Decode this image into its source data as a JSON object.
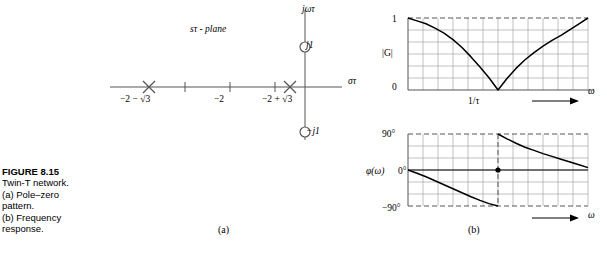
{
  "caption": {
    "figure_number": "FIGURE 8.15",
    "lines": [
      "Twin-T network.",
      "(a) Pole–zero",
      "pattern.",
      "(b) Frequency",
      "response."
    ]
  },
  "subfigure_labels": {
    "a": "(a)",
    "b": "(b)"
  },
  "colors": {
    "curve": "#000000",
    "axis": "#555555",
    "grid": "#999999",
    "dashed": "#555555",
    "marker": "#555555",
    "text": "#000000"
  },
  "pole_zero_plot": {
    "plane_label": "sτ - plane",
    "real_axis_label": "στ",
    "imag_axis_label": "jωτ",
    "tick_labels": [
      "−2 − √3",
      "−2",
      "−2 + √3"
    ],
    "zero_labels": [
      "j1",
      "−j1"
    ],
    "poles": [
      {
        "label": "−2 − √3",
        "real": -3.732,
        "imag": 0,
        "marker": "cross"
      },
      {
        "label": "−2 + √3",
        "real": -0.268,
        "imag": 0,
        "marker": "cross"
      }
    ],
    "zeros": [
      {
        "label": "j1",
        "real": 0,
        "imag": 1,
        "marker": "circle"
      },
      {
        "label": "−j1",
        "real": 0,
        "imag": -1,
        "marker": "circle"
      }
    ]
  },
  "chart_data": [
    {
      "type": "line",
      "id": "magnitude",
      "title": "",
      "ylabel": "|G|",
      "xlabel": "ω",
      "ytick_labels": [
        "1",
        "0"
      ],
      "ytick_values": [
        1,
        0
      ],
      "xtick_labels": [
        "1/τ"
      ],
      "xtick_values": [
        1
      ],
      "ylim": [
        0,
        1
      ],
      "xlim": [
        0,
        2
      ],
      "grid": true,
      "grid_cols": 12,
      "grid_rows": 6,
      "notch_frequency": "1/τ",
      "dashed_reference": 1,
      "x": [
        0,
        0.1,
        0.2,
        0.3,
        0.4,
        0.5,
        0.6,
        0.7,
        0.8,
        0.9,
        1.0,
        1.1,
        1.2,
        1.3,
        1.4,
        1.5,
        1.6,
        1.7,
        1.8,
        1.9,
        2.0
      ],
      "values": [
        1.0,
        0.96,
        0.92,
        0.86,
        0.79,
        0.7,
        0.59,
        0.46,
        0.32,
        0.17,
        0.0,
        0.16,
        0.3,
        0.42,
        0.52,
        0.61,
        0.69,
        0.76,
        0.84,
        0.92,
        1.0
      ]
    },
    {
      "type": "line",
      "id": "phase",
      "title": "",
      "ylabel": "φ(ω)",
      "xlabel": "ω",
      "ytick_labels": [
        "90°",
        "0°",
        "−90°"
      ],
      "ytick_values": [
        90,
        0,
        -90
      ],
      "xtick_labels": [],
      "ylim": [
        -90,
        90
      ],
      "xlim": [
        0,
        2
      ],
      "grid": true,
      "grid_cols": 12,
      "grid_rows": 6,
      "discontinuity_at": "1/τ",
      "marker_point": {
        "x": 1,
        "y": 0,
        "style": "filled-dot"
      },
      "branches": [
        {
          "name": "below-notch",
          "x": [
            0,
            0.1,
            0.2,
            0.3,
            0.4,
            0.5,
            0.6,
            0.7,
            0.8,
            0.9,
            1.0
          ],
          "values": [
            0,
            -8,
            -17,
            -27,
            -37,
            -47,
            -57,
            -67,
            -76,
            -84,
            -90
          ]
        },
        {
          "name": "above-notch",
          "x": [
            1.0,
            1.1,
            1.2,
            1.3,
            1.4,
            1.5,
            1.6,
            1.7,
            1.8,
            1.9,
            2.0
          ],
          "values": [
            90,
            78,
            67,
            57,
            49,
            41,
            34,
            27,
            20,
            13,
            6
          ]
        }
      ]
    }
  ]
}
